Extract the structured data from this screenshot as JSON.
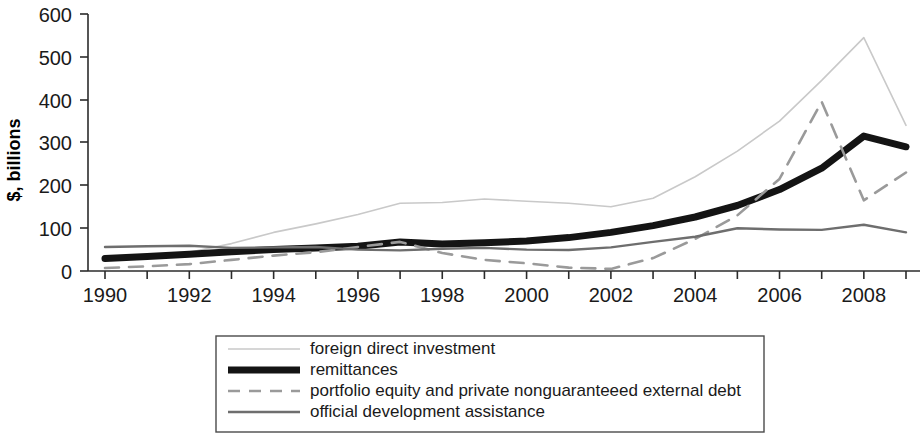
{
  "chart_data": {
    "type": "line",
    "title": "",
    "subtitle": "",
    "xlabel": "",
    "ylabel": "$, billions",
    "x": [
      1990,
      1991,
      1992,
      1993,
      1994,
      1995,
      1996,
      1997,
      1998,
      1999,
      2000,
      2001,
      2002,
      2003,
      2004,
      2005,
      2006,
      2007,
      2008,
      2009
    ],
    "xlim": [
      1990,
      2009
    ],
    "ylim": [
      0,
      600
    ],
    "xticks": [
      1990,
      1992,
      1994,
      1996,
      1998,
      2000,
      2002,
      2004,
      2006,
      2008
    ],
    "xticklabels": [
      "1990",
      "1992",
      "1994",
      "1996",
      "1998",
      "2000",
      "2002",
      "2004",
      "2006",
      "2008"
    ],
    "yticks": [
      0,
      100,
      200,
      300,
      400,
      500,
      600
    ],
    "yticklabels": [
      "0",
      "100",
      "200",
      "300",
      "400",
      "500",
      "600"
    ],
    "grid": false,
    "legend_position": "below-center",
    "series": [
      {
        "name": "foreign direct investment",
        "style": "thin-light-solid",
        "color": "#c9c9c9",
        "width": 1.6,
        "dash": "none",
        "values": [
          24,
          33,
          44,
          64,
          90,
          110,
          132,
          158,
          160,
          168,
          163,
          158,
          150,
          170,
          220,
          280,
          350,
          445,
          545,
          340
        ]
      },
      {
        "name": "remittances",
        "style": "thick-black-solid",
        "color": "#141414",
        "width": 7,
        "dash": "none",
        "values": [
          29,
          34,
          39,
          45,
          50,
          54,
          58,
          68,
          63,
          66,
          70,
          78,
          90,
          106,
          126,
          153,
          190,
          240,
          315,
          290
        ]
      },
      {
        "name": "portfolio equity and private nonguaranteeed external debt",
        "style": "light-dashed",
        "color": "#9a9a9a",
        "width": 2.6,
        "dash": "14,10",
        "values": [
          7,
          11,
          16,
          26,
          36,
          44,
          56,
          68,
          42,
          26,
          18,
          8,
          5,
          30,
          75,
          130,
          215,
          395,
          165,
          230
        ]
      },
      {
        "name": "official development assistance",
        "style": "medium-gray-solid",
        "color": "#6e6e6e",
        "width": 2.4,
        "dash": "none",
        "values": [
          56,
          58,
          59,
          54,
          55,
          56,
          50,
          48,
          52,
          54,
          50,
          49,
          55,
          68,
          80,
          100,
          97,
          96,
          108,
          90
        ]
      }
    ]
  },
  "axes": {
    "y_axis_title": "$, billions",
    "y_tick_labels": [
      "600",
      "500",
      "400",
      "300",
      "200",
      "100",
      "0"
    ],
    "x_tick_labels": [
      "1990",
      "1992",
      "1994",
      "1996",
      "1998",
      "2000",
      "2002",
      "2004",
      "2006",
      "2008"
    ]
  },
  "legend": {
    "items": [
      {
        "label": "foreign direct investment",
        "swatch": "fdi-line-swatch"
      },
      {
        "label": "remittances",
        "swatch": "remittances-line-swatch"
      },
      {
        "label": "portfolio equity and private nonguaranteeed external debt",
        "swatch": "portfolio-line-swatch"
      },
      {
        "label": "official development assistance",
        "swatch": "oda-line-swatch"
      }
    ]
  }
}
